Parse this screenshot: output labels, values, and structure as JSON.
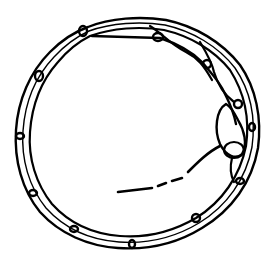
{
  "diagram": {
    "stroke_color": "#000000",
    "background": "#ffffff",
    "ring": {
      "cx": 136,
      "cy": 132,
      "outer_r": 118,
      "inner_r": 106
    },
    "segment_count": 12,
    "loops": [
      {
        "x": 83,
        "y": 31
      },
      {
        "x": 40,
        "y": 78
      },
      {
        "x": 22,
        "y": 135
      },
      {
        "x": 33,
        "y": 192
      },
      {
        "x": 75,
        "y": 230
      },
      {
        "x": 132,
        "y": 246
      },
      {
        "x": 196,
        "y": 218
      },
      {
        "x": 237,
        "y": 180
      },
      {
        "x": 252,
        "y": 126
      },
      {
        "x": 202,
        "y": 37
      },
      {
        "x": 155,
        "y": 38
      },
      {
        "x": 226,
        "y": 164
      }
    ]
  }
}
